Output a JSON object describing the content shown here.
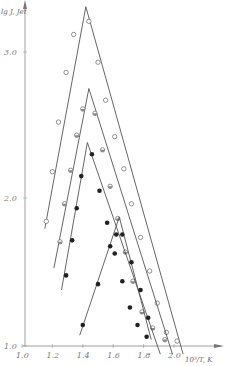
{
  "chart_data": {
    "type": "line",
    "title": "",
    "xlabel": "10³/T, K",
    "ylabel": "lg J, Jet",
    "xlim": [
      1.0,
      2.1
    ],
    "ylim": [
      1.0,
      3.5
    ],
    "grid": false,
    "legend": null,
    "x_ticks": [
      "1.0",
      "1.2",
      "1.4",
      "1.6",
      "1.8",
      "2.0"
    ],
    "y_ticks": [
      "1.0",
      "2.0",
      "3.0"
    ],
    "series": [
      {
        "name": "curve-1",
        "marker": "open-circle",
        "line": [
          [
            1.15,
            1.79
          ],
          [
            1.42,
            3.31
          ],
          [
            2.06,
            0.93
          ]
        ],
        "points": [
          [
            1.16,
            1.84
          ],
          [
            1.2,
            2.18
          ],
          [
            1.24,
            2.52
          ],
          [
            1.29,
            2.86
          ],
          [
            1.34,
            3.12
          ],
          [
            1.39,
            3.48
          ],
          [
            1.44,
            3.21
          ],
          [
            1.5,
            2.93
          ],
          [
            1.55,
            2.67
          ],
          [
            1.61,
            2.42
          ],
          [
            1.67,
            2.2
          ],
          [
            1.72,
            1.96
          ],
          [
            1.78,
            1.73
          ],
          [
            1.84,
            1.5
          ],
          [
            1.89,
            1.28
          ],
          [
            1.95,
            1.08
          ],
          [
            2.02,
            1.02
          ]
        ]
      },
      {
        "name": "curve-2",
        "marker": "half-circle",
        "line": [
          [
            1.21,
            1.52
          ],
          [
            1.44,
            2.75
          ],
          [
            1.99,
            0.93
          ]
        ],
        "points": [
          [
            1.25,
            1.7
          ],
          [
            1.28,
            1.96
          ],
          [
            1.32,
            2.19
          ],
          [
            1.36,
            2.43
          ],
          [
            1.4,
            2.61
          ],
          [
            1.48,
            2.58
          ],
          [
            1.53,
            2.33
          ],
          [
            1.58,
            2.08
          ],
          [
            1.63,
            1.86
          ],
          [
            1.68,
            1.63
          ],
          [
            1.73,
            1.43
          ],
          [
            1.79,
            1.22
          ],
          [
            1.86,
            1.11
          ],
          [
            1.94,
            1.03
          ]
        ]
      },
      {
        "name": "curve-3",
        "marker": "filled-circle",
        "line": [
          [
            1.26,
            1.37
          ],
          [
            1.43,
            2.38
          ],
          [
            1.91,
            0.93
          ]
        ],
        "points": [
          [
            1.29,
            1.47
          ],
          [
            1.33,
            1.71
          ],
          [
            1.36,
            1.93
          ],
          [
            1.39,
            2.15
          ],
          [
            1.46,
            2.3
          ],
          [
            1.51,
            2.05
          ],
          [
            1.56,
            1.83
          ],
          [
            1.61,
            1.62
          ],
          [
            1.66,
            1.43
          ],
          [
            1.71,
            1.25
          ],
          [
            1.76,
            1.13
          ],
          [
            1.82,
            1.05
          ]
        ]
      },
      {
        "name": "curve-4",
        "marker": "filled-circle",
        "line": [
          [
            1.38,
            1.06
          ],
          [
            1.64,
            1.87
          ],
          [
            1.85,
            1.03
          ]
        ],
        "points": [
          [
            1.4,
            1.13
          ],
          [
            1.5,
            1.41
          ],
          [
            1.58,
            1.67
          ],
          [
            1.62,
            1.75
          ],
          [
            1.66,
            1.75
          ],
          [
            1.72,
            1.56
          ],
          [
            1.78,
            1.37
          ],
          [
            1.83,
            1.18
          ]
        ]
      }
    ]
  }
}
